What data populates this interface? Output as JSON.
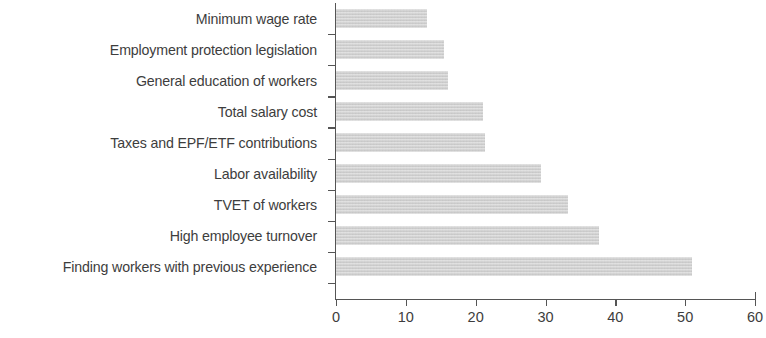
{
  "chart_data": {
    "type": "bar",
    "orientation": "horizontal",
    "title": "",
    "subtitle": "",
    "xlabel": "",
    "ylabel": "",
    "xlim": [
      0,
      60
    ],
    "ylim": null,
    "grid": false,
    "legend": null,
    "legend_position": "none",
    "bar_color": "#cfcfcf",
    "axis_color": "#555555",
    "text_color": "#3d3d3d",
    "xticks": [
      0,
      10,
      20,
      30,
      40,
      50,
      60
    ],
    "xtick_labels": [
      "0",
      "10",
      "20",
      "30",
      "40",
      "50",
      "60"
    ],
    "categories": [
      "Minimum wage rate",
      "Employment protection legislation",
      "General education of workers",
      "Total salary cost",
      "Taxes and EPF/ETF contributions",
      "Labor availability",
      "TVET of workers",
      "High employee turnover",
      "Finding workers with previous experience"
    ],
    "values": [
      13,
      15.5,
      16,
      21,
      21.3,
      29.4,
      33.2,
      37.7,
      51
    ],
    "series": [
      {
        "name": "",
        "values": [
          13,
          15.5,
          16,
          21,
          21.3,
          29.4,
          33.2,
          37.7,
          51
        ]
      }
    ]
  }
}
